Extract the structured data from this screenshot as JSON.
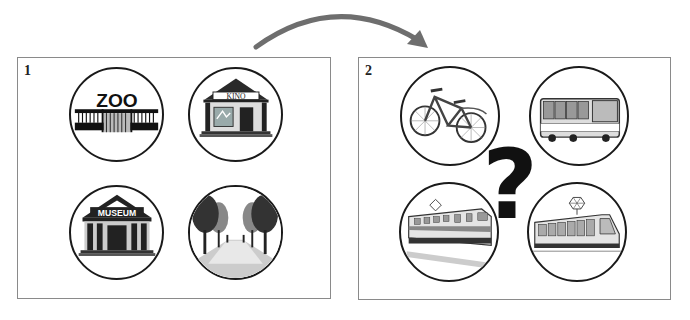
{
  "arrow": {
    "color": "#6e6e6e"
  },
  "panels": [
    {
      "label": "1",
      "items": [
        {
          "name": "zoo",
          "sign": "ZOO"
        },
        {
          "name": "cinema",
          "sign": "KINO"
        },
        {
          "name": "museum",
          "sign": "MUSEUM"
        },
        {
          "name": "park",
          "sign": ""
        }
      ]
    },
    {
      "label": "2",
      "items": [
        {
          "name": "bicycle"
        },
        {
          "name": "bus"
        },
        {
          "name": "train"
        },
        {
          "name": "tram"
        }
      ],
      "center_symbol": "?"
    }
  ]
}
